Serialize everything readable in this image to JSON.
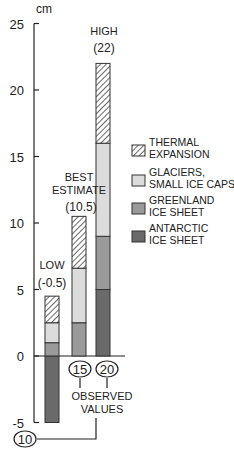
{
  "chart_data": {
    "type": "bar",
    "stacked": true,
    "title": "",
    "ylabel": "cm",
    "xlabel": "",
    "ylim": [
      -5,
      25
    ],
    "yticks": [
      -5,
      0,
      5,
      10,
      15,
      20,
      25
    ],
    "categories": [
      "LOW",
      "BEST ESTIMATE",
      "HIGH"
    ],
    "totals": [
      -0.5,
      10.5,
      22
    ],
    "category_labels": [
      {
        "name": "LOW",
        "value_label": "(-0.5)"
      },
      {
        "name": "BEST",
        "name2": "ESTIMATE",
        "value_label": "(10.5)"
      },
      {
        "name": "HIGH",
        "value_label": "(22)"
      }
    ],
    "series": [
      {
        "name": "ANTARCTIC ICE SHEET",
        "values": [
          -5,
          0,
          5
        ]
      },
      {
        "name": "GREENLAND ICE SHEET",
        "values": [
          1,
          2.5,
          4
        ]
      },
      {
        "name": "GLACIERS, SMALL ICE CAPS",
        "values": [
          1.5,
          4.1,
          7
        ]
      },
      {
        "name": "THERMAL EXPANSION",
        "values": [
          2,
          3.9,
          6
        ]
      }
    ],
    "legend": [
      {
        "line1": "THERMAL",
        "line2": "EXPANSION",
        "pattern": "hatched"
      },
      {
        "line1": "GLACIERS,",
        "line2": "SMALL ICE CAPS",
        "color": "#dcdcdc"
      },
      {
        "line1": "GREENLAND",
        "line2": "ICE SHEET",
        "color": "#9a9a9a"
      },
      {
        "line1": "ANTARCTIC",
        "line2": "ICE SHEET",
        "color": "#6a6a6a"
      }
    ],
    "legend_position": "right",
    "grid": false,
    "annotations": {
      "observed_values": [
        10,
        15,
        20
      ],
      "observed_label_line1": "OBSERVED",
      "observed_label_line2": "VALUES"
    }
  },
  "colors": {
    "thermal_fill": "#ffffff",
    "thermal_hatch": "#444444",
    "glaciers": "#dcdcdc",
    "greenland": "#9a9a9a",
    "antarctic": "#6a6a6a",
    "axis": "#222222"
  }
}
